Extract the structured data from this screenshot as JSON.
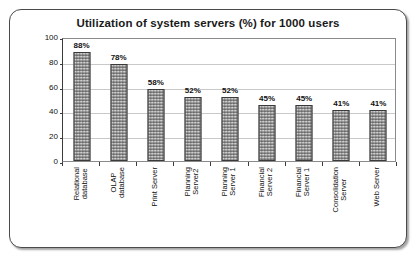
{
  "chart_data": {
    "type": "bar",
    "title": "Utilization of system servers (%) for 1000 users",
    "xlabel": "",
    "ylabel": "",
    "ylim": [
      0,
      100
    ],
    "yticks": [
      0,
      20,
      40,
      60,
      80,
      100
    ],
    "grid": true,
    "legend": false,
    "categories": [
      "Relational database",
      "OLAP database",
      "Print Server",
      "Planning Server2",
      "Planning Server 1",
      "Financial Server 2",
      "Financial Server 1",
      "Consolidation Server",
      "Web Server"
    ],
    "category_lines": [
      [
        "Relational",
        "database"
      ],
      [
        "OLAP",
        "database"
      ],
      [
        "Print Server"
      ],
      [
        "Planning",
        "Server2"
      ],
      [
        "Planning",
        "Server 1"
      ],
      [
        "Financial",
        "Server 2"
      ],
      [
        "Financial",
        "Server 1"
      ],
      [
        "Consolidation",
        "Server"
      ],
      [
        "Web Server"
      ]
    ],
    "values": [
      88,
      78,
      58,
      52,
      52,
      45,
      45,
      41,
      41
    ],
    "data_labels": [
      "88%",
      "78%",
      "58%",
      "52%",
      "52%",
      "45%",
      "45%",
      "41%",
      "41%"
    ],
    "ytick_labels": [
      "0",
      "20",
      "40",
      "60",
      "80",
      "100"
    ],
    "colors": {
      "bar_fill": "#8e8e8e",
      "bar_border": "#3a3a3a",
      "gridline": "#c9c9c9",
      "axis": "#3b3b3b",
      "plot_background": "#ffffff",
      "card_border": "#4a4a4a",
      "text": "#111111"
    }
  }
}
